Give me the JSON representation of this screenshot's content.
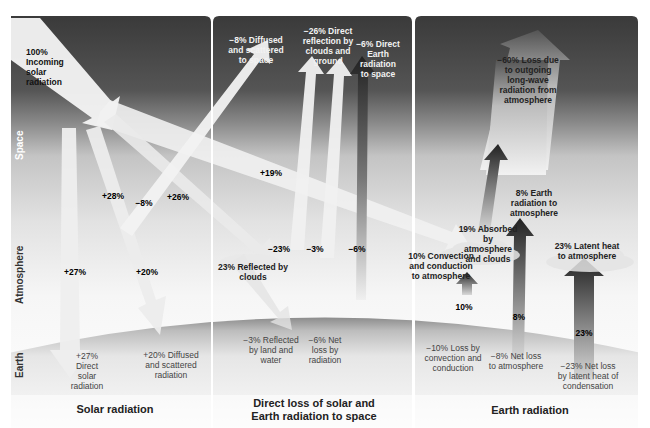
{
  "zones": {
    "space": "Space",
    "atmosphere": "Atmosphere",
    "earth": "Earth"
  },
  "colors": {
    "space_dark": "#3e3e3e",
    "space_mid": "#6a6a6a",
    "atmosphere_light": "#e8e8e8",
    "earth_gray": "#a8a8a8",
    "arrow_light": "#f4f4f4",
    "arrow_dark": "#2a2a2a"
  },
  "panels": [
    {
      "id": "solar",
      "title": "Solar radiation",
      "labels": {
        "incoming": "100% Incoming solar radiation",
        "p28": "+28%",
        "m8": "−8%",
        "p26": "+26%",
        "p27": "+27%",
        "p20": "+20%",
        "p19": "+19%",
        "earth_direct": "+27% Direct solar radiation",
        "earth_diffused": "+20% Diffused and scattered radiation"
      }
    },
    {
      "id": "direct-loss",
      "title": "Direct loss of solar and Earth radiation to space",
      "labels": {
        "diffused_space": "−8% Diffused and scattered to space",
        "direct_reflection": "−26% Direct reflection by clouds and ground",
        "direct_earth": "−6% Direct Earth radiation to space",
        "m23": "−23%",
        "m3": "−3%",
        "m6": "−6%",
        "reflected_clouds": "23% Reflected by clouds",
        "earth_reflected": "−3% Reflected by land and water",
        "earth_netloss": "−6% Net loss by radiation"
      }
    },
    {
      "id": "earth",
      "title": "Earth radiation",
      "labels": {
        "loss60": "−60% Loss due to outgoing long-wave radiation from atmosphere",
        "earth8": "8% Earth radiation to atmosphere",
        "absorbed19": "19% Absorbed by atmosphere and clouds",
        "convection10": "10% Convection and conduction to atmosphere",
        "latent23": "23% Latent heat to atmosphere",
        "p10": "10%",
        "p8": "8%",
        "p23": "23%",
        "earth_conv": "−10% Loss by convection and conduction",
        "earth_net8": "−8% Net loss to atmosphere",
        "earth_latent": "−23% Net loss by latent heat of condensation"
      }
    }
  ]
}
